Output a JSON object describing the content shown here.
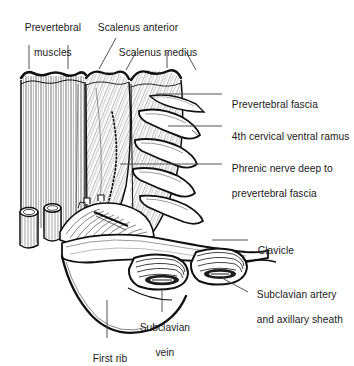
{
  "figure": {
    "background_color": "#ffffff",
    "ink_color": "#1a1a1a",
    "leader_color": "#4a4a4a"
  },
  "labels": {
    "prevertebral_muscles": {
      "line1": "Prevertebral",
      "line2": "muscles"
    },
    "scalenus_anterior": {
      "line1": "Scalenus anterior"
    },
    "scalenus_medius": {
      "line1": "Scalenus medius"
    },
    "prevertebral_fascia": {
      "line1": "Prevertebral fascia"
    },
    "fourth_cervical_ventral_ramus": {
      "line1": "4th cervical ventral ramus"
    },
    "phrenic_nerve": {
      "line1": "Phrenic nerve deep to",
      "line2": "prevertebral fascia"
    },
    "clavicle": {
      "line1": "Clavicle"
    },
    "subclavian_artery": {
      "line1": "Subclavian artery",
      "line2": "and axillary sheath"
    },
    "subclavian_vein": {
      "line1": "Subclavian",
      "line2": "vein"
    },
    "first_rib": {
      "line1": "First rib"
    }
  },
  "structures": [
    {
      "name": "prevertebral-muscles",
      "hatching": "vertical"
    },
    {
      "name": "scalenus-anterior",
      "hatching": "diagonal"
    },
    {
      "name": "scalenus-medius",
      "hatching": "diagonal"
    },
    {
      "name": "prevertebral-fascia",
      "hatching": "fine-diagonal"
    },
    {
      "name": "cervical-ventral-rami",
      "count": 4
    },
    {
      "name": "phrenic-nerve",
      "style": "dotted"
    },
    {
      "name": "clavicle",
      "hatching": "contour"
    },
    {
      "name": "subclavian-artery",
      "hatching": "concentric"
    },
    {
      "name": "subclavian-vein",
      "hatching": "concentric"
    },
    {
      "name": "first-rib",
      "hatching": "outline"
    },
    {
      "name": "cut-vessel-stumps",
      "count": 2
    }
  ]
}
